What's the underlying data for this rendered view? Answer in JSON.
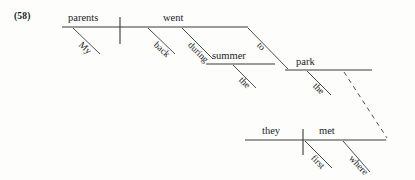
{
  "figure": {
    "number": "(58)",
    "sentence": "My parents went back during the summer to the park where they first met",
    "type": "reed-kellogg-sentence-diagram"
  },
  "colors": {
    "ink": "#1c1c1c",
    "line": "#3a3a3a",
    "background": "#fdfdfc"
  },
  "main_clause": {
    "subject": "parents",
    "subject_modifier": "My",
    "verb": "went",
    "verb_modifier": "back"
  },
  "prepositional_phrase_1": {
    "preposition": "during",
    "object": "summer",
    "object_modifier": "the"
  },
  "prepositional_phrase_2": {
    "preposition": "to",
    "object": "park",
    "object_modifier": "the"
  },
  "relative_clause": {
    "subject": "they",
    "verb": "met",
    "verb_modifier_1": "first",
    "relative_adverb": "where"
  },
  "connector": {
    "style": "dashed",
    "label": ""
  }
}
